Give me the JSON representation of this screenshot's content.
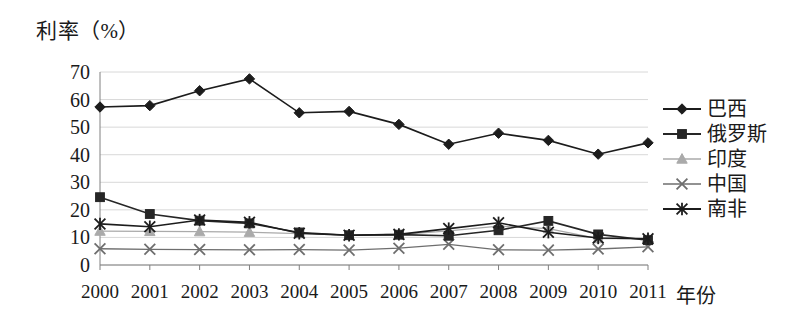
{
  "chart_data": {
    "type": "line",
    "title": "",
    "ylabel": "利率（%）",
    "xlabel": "年份",
    "ylim": [
      0,
      70
    ],
    "ytick_step": 10,
    "yticks": [
      "70",
      "60",
      "50",
      "40",
      "30",
      "20",
      "10",
      "0"
    ],
    "ytick_values": [
      70,
      60,
      50,
      40,
      30,
      20,
      10,
      0
    ],
    "grid": true,
    "legend_position": "right",
    "categories": [
      "2000",
      "2001",
      "2002",
      "2003",
      "2004",
      "2005",
      "2006",
      "2007",
      "2008",
      "2009",
      "2010",
      "2011"
    ],
    "x": [
      2000,
      2001,
      2002,
      2003,
      2004,
      2005,
      2006,
      2007,
      2008,
      2009,
      2010,
      2011
    ],
    "series": [
      {
        "name": "巴西",
        "marker": "diamond",
        "color": "#1c1c1c",
        "values": [
          57.3,
          57.8,
          63.2,
          67.5,
          55.2,
          55.7,
          51.0,
          43.8,
          47.8,
          45.2,
          40.2,
          44.3
        ]
      },
      {
        "name": "俄罗斯",
        "marker": "square",
        "color": "#262626",
        "values": [
          24.6,
          18.5,
          16.1,
          15.1,
          11.8,
          10.8,
          11.0,
          10.6,
          12.6,
          16.0,
          11.1,
          9.0
        ]
      },
      {
        "name": "印度",
        "marker": "triangle",
        "color": "#aaaaaa",
        "values": [
          12.3,
          12.2,
          12.1,
          11.9,
          11.4,
          10.8,
          11.0,
          12.4,
          14.1,
          13.2,
          9.6,
          9.6
        ]
      },
      {
        "name": "中国",
        "marker": "cross",
        "color": "#6e6e6e",
        "values": [
          5.9,
          5.7,
          5.6,
          5.5,
          5.6,
          5.4,
          6.1,
          7.5,
          5.5,
          5.4,
          5.8,
          6.6
        ]
      },
      {
        "name": "南非",
        "marker": "star",
        "color": "#1c1c1c",
        "values": [
          14.9,
          13.9,
          16.3,
          15.5,
          11.5,
          10.8,
          11.1,
          13.2,
          15.3,
          11.9,
          9.8,
          9.5
        ]
      }
    ]
  },
  "axis": {
    "y_title": "利率（%）",
    "x_title": "年份"
  },
  "legend": {
    "items": [
      {
        "label": "巴西"
      },
      {
        "label": "俄罗斯"
      },
      {
        "label": "印度"
      },
      {
        "label": "中国"
      },
      {
        "label": "南非"
      }
    ]
  },
  "colors": {
    "axis": "#808080",
    "grid": "#d8d8d8",
    "dark": "#1c1c1c",
    "mid": "#6e6e6e",
    "light": "#aaaaaa",
    "background": "#ffffff"
  }
}
